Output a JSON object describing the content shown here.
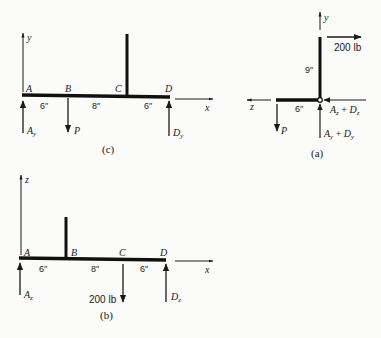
{
  "figure": {
    "diagram_c": {
      "caption": "(c)",
      "axis_vertical": "y",
      "axis_horizontal": "x",
      "points": [
        "A",
        "B",
        "C",
        "D"
      ],
      "dimensions": [
        "6″",
        "8″",
        "6″"
      ],
      "forces": {
        "left": "A",
        "left_sub": "y",
        "load": "P",
        "right": "D",
        "right_sub": "y"
      }
    },
    "diagram_a": {
      "caption": "(a)",
      "axis_vertical": "y",
      "axis_horizontal": "z",
      "load_label": "200 lb",
      "vertical_dim": "9″",
      "horizontal_dim": "6″",
      "horizontal_force": {
        "a": "A",
        "a_sub": "z",
        "plus": " + ",
        "d": "D",
        "d_sub": "z"
      },
      "vertical_force": {
        "a": "A",
        "a_sub": "y",
        "plus": " + ",
        "d": "D",
        "d_sub": "y"
      },
      "load": "P"
    },
    "diagram_b": {
      "caption": "(b)",
      "axis_vertical": "z",
      "axis_horizontal": "x",
      "points": [
        "A",
        "B",
        "C",
        "D"
      ],
      "dimensions": [
        "6″",
        "8″",
        "6″"
      ],
      "load_label": "200 lb",
      "forces": {
        "left": "A",
        "left_sub": "z",
        "right": "D",
        "right_sub": "z"
      }
    }
  }
}
